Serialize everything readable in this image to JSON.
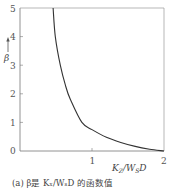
{
  "chart_data": {
    "type": "line",
    "title": "",
    "caption": "(a) β是 K_Z/W_S D 的函数值",
    "xlabel": "K_Z/W_S D",
    "ylabel": "β",
    "xlim": [
      0,
      2
    ],
    "ylim": [
      0,
      5
    ],
    "xticks": [
      "1",
      "2"
    ],
    "yticks": [
      "0",
      "1",
      "2",
      "3",
      "4",
      "5"
    ],
    "grid": false,
    "legend": null,
    "series": [
      {
        "name": "β",
        "x": [
          0.46,
          0.49,
          0.56,
          0.63,
          0.7,
          0.86,
          1.0,
          1.2,
          1.4,
          1.6,
          1.8,
          2.0
        ],
        "y": [
          5.0,
          4.0,
          3.0,
          2.3,
          1.8,
          1.0,
          0.75,
          0.48,
          0.3,
          0.16,
          0.06,
          0.0
        ]
      }
    ]
  },
  "labels": {
    "x_axis": "K",
    "x_axis_sub": "Z",
    "x_axis_mid": "/W",
    "x_axis_sub2": "S",
    "x_axis_end": "D",
    "y_axis": "β",
    "caption": "(a) β是 Kₓ/WₛD 的函数值",
    "tick_y": [
      "0",
      "1",
      "2",
      "3",
      "4",
      "5"
    ],
    "tick_x": [
      "1",
      "2"
    ]
  }
}
